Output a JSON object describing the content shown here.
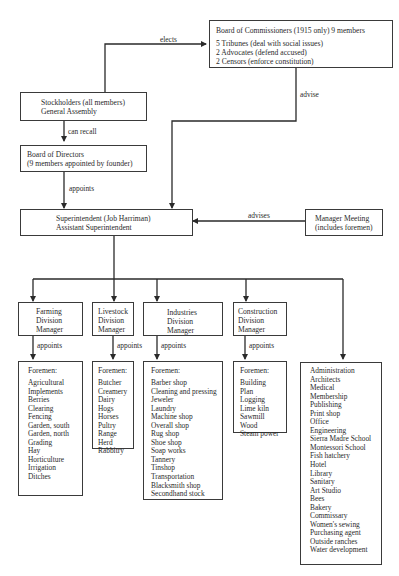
{
  "board_of_commissioners": {
    "title": "Board of Commissioners (1915 only) 9 members",
    "lines": [
      "5 Tribunes (deal with social issues)",
      "2 Advocates (defend accused)",
      "2 Censors (enforce constitution)"
    ]
  },
  "stockholders": {
    "line1": "Stockholders (all members)",
    "line2": "General Assembly"
  },
  "board_of_directors": {
    "line1": "Board of Directors",
    "line2": "(9 members appointed by founder)"
  },
  "superintendent": {
    "line1": "Superintendent (Job Harriman)",
    "line2": "Assistant Superintendent"
  },
  "manager_meeting": {
    "line1": "Manager Meeting",
    "line2": "(includes foremen)"
  },
  "edge_labels": {
    "elects": "elects",
    "can_recall": "can recall",
    "appoints": "appoints",
    "advise": "advise",
    "advises": "advises"
  },
  "divisions": [
    {
      "name": [
        "Farming",
        "Division",
        "Manager"
      ],
      "appoints": "appoints",
      "foremen_title": "Foremen:",
      "foremen": [
        "Agricultural",
        "Implements",
        "Berries",
        "Clearing",
        "Fencing",
        "Garden, south",
        "Garden, north",
        "Grading",
        "Hay",
        "Horticulture",
        "Irrigation",
        "Ditches"
      ]
    },
    {
      "name": [
        "Livestock",
        "Division",
        "Manager"
      ],
      "appoints": "appoints",
      "foremen_title": "Foremen:",
      "foremen": [
        "Butcher",
        "Creamery",
        "Dairy",
        "Hogs",
        "Horses",
        "Pultry",
        "Range",
        "Herd",
        "Rabbitry"
      ]
    },
    {
      "name": [
        "Industries",
        "Division",
        "Manager"
      ],
      "appoints": "appoints",
      "foremen_title": "Foremen:",
      "foremen": [
        "Barber shop",
        "Cleaning and pressing",
        "Jeweler",
        "Laundry",
        "Machine shop",
        "Overall shop",
        "Rug shop",
        "Shoe shop",
        "Soap works",
        "Tannery",
        "Tinshop",
        "Transportation",
        "Blacksmith shop",
        "Secondhand stock"
      ]
    },
    {
      "name": [
        "Construction",
        "Division",
        "Manager"
      ],
      "appoints": "appoints",
      "foremen_title": "Foremen:",
      "foremen": [
        "Building",
        "Plan",
        "Logging",
        "Lime kiln",
        "Sawmill",
        "Wood",
        "Steam power"
      ]
    }
  ],
  "administration": [
    "Administration",
    "Architects",
    "Medical",
    "Membership",
    "Publishing",
    "Print shop",
    "Office",
    "Engineering",
    "Sierra Madre School",
    "Montessori School",
    "Fish hatchery",
    "Hotel",
    "Library",
    "Sanitary",
    "Art Studio",
    "Bees",
    "Bakery",
    "Commissary",
    "Women's sewing",
    "Purchasing agent",
    "Outside ranches",
    "Water development"
  ]
}
